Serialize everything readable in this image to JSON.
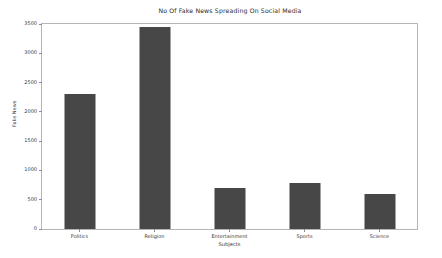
{
  "chart_data": {
    "type": "bar",
    "title": "No Of Fake News Spreading On Social Media",
    "xlabel": "Subjects",
    "ylabel": "Fake News",
    "categories": [
      "Politics",
      "Religion",
      "Entertainment",
      "Sports",
      "Science"
    ],
    "values": [
      2300,
      3450,
      700,
      780,
      600
    ],
    "ylim": [
      0,
      3500
    ],
    "yticks": [
      0,
      500,
      1000,
      1500,
      2000,
      2500,
      3000,
      3500
    ],
    "ytick_labels": [
      "0",
      "500",
      "1000",
      "1500",
      "2000",
      "2500",
      "3000",
      "3500"
    ],
    "grid": false,
    "legend": false,
    "bar_color": "#474747",
    "background_color": "#ffffff",
    "axes_color": "#b5b5b5"
  }
}
